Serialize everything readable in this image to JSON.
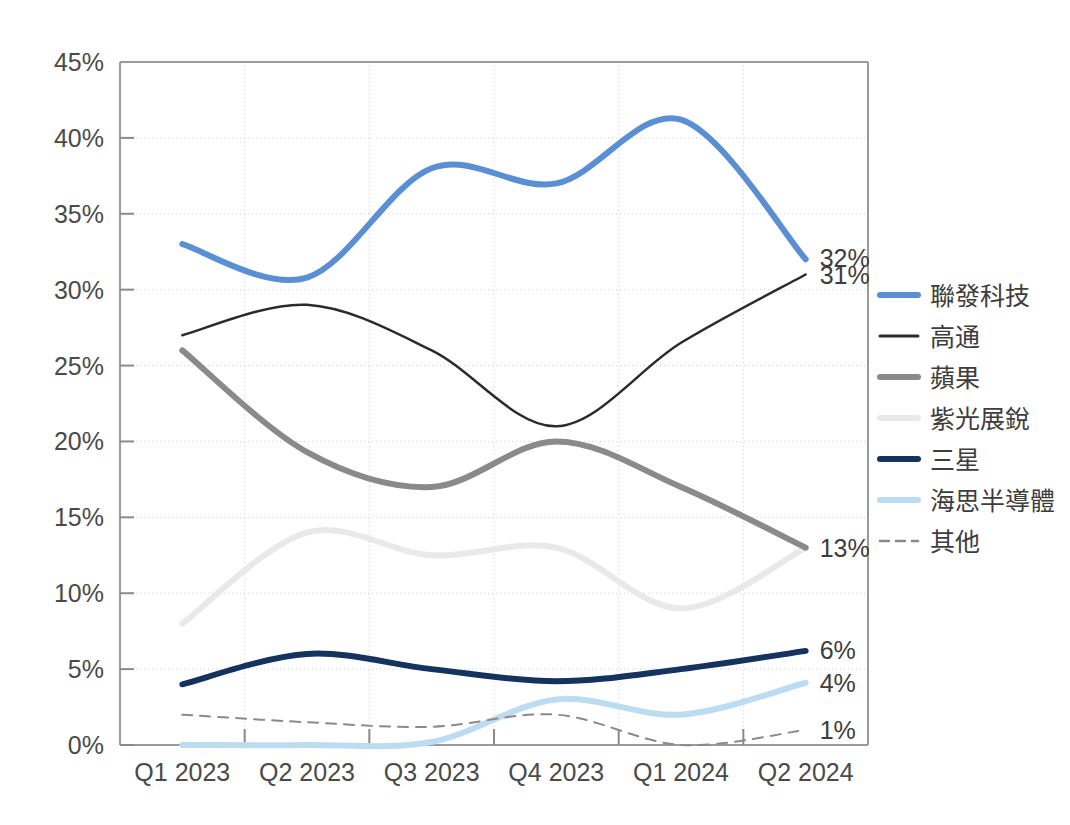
{
  "chart_data": {
    "type": "line",
    "title": "",
    "xlabel": "",
    "ylabel": "",
    "categories": [
      "Q1 2023",
      "Q2 2023",
      "Q3 2023",
      "Q4 2023",
      "Q1 2024",
      "Q2 2024"
    ],
    "ylim": [
      0,
      45
    ],
    "y_ticks": [
      "0%",
      "5%",
      "10%",
      "15%",
      "20%",
      "25%",
      "30%",
      "35%",
      "40%",
      "45%"
    ],
    "y_tick_values": [
      0,
      5,
      10,
      15,
      20,
      25,
      30,
      35,
      40,
      45
    ],
    "grid": false,
    "legend_position": "right",
    "value_unit": "%",
    "series": [
      {
        "name": "聯發科技",
        "color": "#5B8FD4",
        "width": 6,
        "dash": "",
        "values": [
          33,
          30.8,
          38,
          37,
          41.2,
          32
        ],
        "end_label": "32%"
      },
      {
        "name": "高通",
        "color": "#2b2b2b",
        "width": 2.5,
        "dash": "",
        "values": [
          27,
          29,
          26,
          21,
          26.5,
          31
        ],
        "end_label": "31%"
      },
      {
        "name": "蘋果",
        "color": "#8a8a8a",
        "width": 6,
        "dash": "",
        "values": [
          26,
          19.3,
          17,
          20,
          17,
          13
        ],
        "end_label": "13%"
      },
      {
        "name": "紫光展銳",
        "color": "#e9e9e9",
        "width": 6,
        "dash": "",
        "values": [
          8,
          14,
          12.5,
          13,
          9,
          13
        ],
        "end_label": ""
      },
      {
        "name": "三星",
        "color": "#14335e",
        "width": 6,
        "dash": "",
        "values": [
          4,
          6,
          5,
          4.2,
          5,
          6.2
        ],
        "end_label": "6%"
      },
      {
        "name": "海思半導體",
        "color": "#bcdcf2",
        "width": 6,
        "dash": "",
        "values": [
          0,
          0,
          0.2,
          3,
          2,
          4.1
        ],
        "end_label": "4%"
      },
      {
        "name": "其他",
        "color": "#8a8a8a",
        "width": 2,
        "dash": "10 8",
        "values": [
          2,
          1.5,
          1.2,
          2,
          0,
          1
        ],
        "end_label": "1%"
      }
    ]
  },
  "axis": {
    "x_labels": [
      "Q1 2023",
      "Q2 2023",
      "Q3 2023",
      "Q4 2023",
      "Q1 2024",
      "Q2 2024"
    ],
    "y_labels": [
      "45%",
      "40%",
      "35%",
      "30%",
      "25%",
      "20%",
      "15%",
      "10%",
      "5%",
      "0%"
    ]
  },
  "end_labels": [
    "32%",
    "31%",
    "13%",
    "6%",
    "4%",
    "1%"
  ],
  "legend": {
    "items": [
      {
        "label": "聯發科技",
        "color": "#5B8FD4",
        "style": "solid-thick"
      },
      {
        "label": "高通",
        "color": "#2b2b2b",
        "style": "solid-thin"
      },
      {
        "label": "蘋果",
        "color": "#8a8a8a",
        "style": "solid-thick"
      },
      {
        "label": "紫光展銳",
        "color": "#e9e9e9",
        "style": "solid-thick"
      },
      {
        "label": "三星",
        "color": "#14335e",
        "style": "solid-thick"
      },
      {
        "label": "海思半導體",
        "color": "#bcdcf2",
        "style": "solid-thick"
      },
      {
        "label": "其他",
        "color": "#8a8a8a",
        "style": "dashed"
      }
    ]
  }
}
